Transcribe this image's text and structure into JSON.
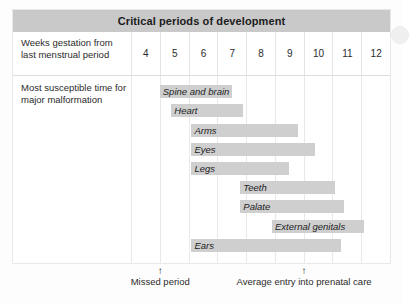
{
  "figure": {
    "title": "Critical periods of development"
  },
  "rows": {
    "weeks": {
      "label": "Weeks gestation from last menstrual period",
      "ticks": [
        "4",
        "5",
        "6",
        "7",
        "8",
        "9",
        "10",
        "11",
        "12"
      ]
    },
    "bars": {
      "label": "Most susceptible time for major malformation"
    }
  },
  "footnotes": [
    {
      "arrow": "↑",
      "text": "Missed period"
    },
    {
      "arrow": "↑",
      "text": "Average entry into prenatal care"
    }
  ],
  "colors": {
    "title_bar": "#c9c9c9",
    "bar_fill": "#cfcfcf",
    "grid_line": "#e9e9e9",
    "text": "#2b2b2b"
  },
  "chart_data": {
    "type": "bar",
    "orientation": "horizontal",
    "title": "Critical periods of development",
    "xlabel": "Weeks gestation from last menstrual period",
    "ylabel": "Most susceptible time for major malformation",
    "xlim": [
      4,
      13
    ],
    "xticks": [
      4,
      5,
      6,
      7,
      8,
      9,
      10,
      11,
      12
    ],
    "grid": true,
    "legend": "none",
    "categories": [
      "Spine and brain",
      "Heart",
      "Arms",
      "Eyes",
      "Legs",
      "Teeth",
      "Palate",
      "External genitals",
      "Ears"
    ],
    "series": [
      {
        "name": "Critical period (weeks gestation)",
        "intervals": [
          {
            "label": "Spine and brain",
            "start": 5.0,
            "end": 7.5
          },
          {
            "label": "Heart",
            "start": 5.4,
            "end": 7.9
          },
          {
            "label": "Arms",
            "start": 6.1,
            "end": 9.8
          },
          {
            "label": "Eyes",
            "start": 6.1,
            "end": 10.4
          },
          {
            "label": "Legs",
            "start": 6.1,
            "end": 9.5
          },
          {
            "label": "Teeth",
            "start": 7.8,
            "end": 11.1
          },
          {
            "label": "Palate",
            "start": 7.8,
            "end": 11.4
          },
          {
            "label": "External genitals",
            "start": 8.9,
            "end": 12.1
          },
          {
            "label": "Ears",
            "start": 6.1,
            "end": 11.3
          }
        ]
      }
    ],
    "annotations": [
      {
        "text": "Missed period",
        "x": 5.05,
        "marker": "up-arrow"
      },
      {
        "text": "Average entry into prenatal care",
        "x": 10.05,
        "marker": "up-arrow"
      }
    ]
  }
}
